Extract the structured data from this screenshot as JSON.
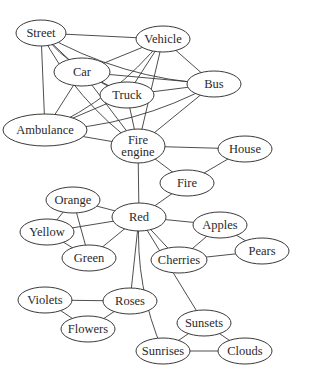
{
  "diagram": {
    "type": "semantic-network",
    "nodes": [
      {
        "id": "street",
        "label": "Street",
        "cx": 41,
        "cy": 33,
        "rx": 25,
        "ry": 13
      },
      {
        "id": "vehicle",
        "label": "Vehicle",
        "cx": 163,
        "cy": 39,
        "rx": 27,
        "ry": 13
      },
      {
        "id": "car",
        "label": "Car",
        "cx": 82,
        "cy": 72,
        "rx": 28,
        "ry": 14
      },
      {
        "id": "bus",
        "label": "Bus",
        "cx": 214,
        "cy": 84,
        "rx": 27,
        "ry": 13
      },
      {
        "id": "truck",
        "label": "Truck",
        "cx": 127,
        "cy": 95,
        "rx": 27,
        "ry": 13
      },
      {
        "id": "ambulance",
        "label": "Ambulance",
        "cx": 45,
        "cy": 130,
        "rx": 42,
        "ry": 16
      },
      {
        "id": "fire-engine",
        "label": "Fire engine",
        "lines": [
          "Fire",
          "engine"
        ],
        "cx": 138,
        "cy": 146,
        "rx": 27,
        "ry": 17
      },
      {
        "id": "house",
        "label": "House",
        "cx": 245,
        "cy": 149,
        "rx": 27,
        "ry": 13
      },
      {
        "id": "fire",
        "label": "Fire",
        "cx": 187,
        "cy": 183,
        "rx": 27,
        "ry": 13
      },
      {
        "id": "orange",
        "label": "Orange",
        "cx": 73,
        "cy": 200,
        "rx": 27,
        "ry": 13
      },
      {
        "id": "red",
        "label": "Red",
        "cx": 139,
        "cy": 217,
        "rx": 27,
        "ry": 14
      },
      {
        "id": "yellow",
        "label": "Yellow",
        "cx": 47,
        "cy": 232,
        "rx": 27,
        "ry": 13
      },
      {
        "id": "apples",
        "label": "Apples",
        "cx": 220,
        "cy": 225,
        "rx": 27,
        "ry": 13
      },
      {
        "id": "green",
        "label": "Green",
        "cx": 89,
        "cy": 258,
        "rx": 27,
        "ry": 13
      },
      {
        "id": "cherries",
        "label": "Cherries",
        "cx": 179,
        "cy": 260,
        "rx": 28,
        "ry": 13
      },
      {
        "id": "pears",
        "label": "Pears",
        "cx": 262,
        "cy": 251,
        "rx": 27,
        "ry": 13
      },
      {
        "id": "violets",
        "label": "Violets",
        "cx": 45,
        "cy": 300,
        "rx": 27,
        "ry": 13
      },
      {
        "id": "roses",
        "label": "Roses",
        "cx": 130,
        "cy": 301,
        "rx": 27,
        "ry": 13
      },
      {
        "id": "flowers",
        "label": "Flowers",
        "cx": 88,
        "cy": 329,
        "rx": 27,
        "ry": 13
      },
      {
        "id": "sunsets",
        "label": "Sunsets",
        "cx": 204,
        "cy": 323,
        "rx": 27,
        "ry": 13
      },
      {
        "id": "sunrises",
        "label": "Sunrises",
        "cx": 163,
        "cy": 351,
        "rx": 27,
        "ry": 13
      },
      {
        "id": "clouds",
        "label": "Clouds",
        "cx": 245,
        "cy": 351,
        "rx": 27,
        "ry": 13
      }
    ],
    "edges": [
      [
        "street",
        "vehicle"
      ],
      [
        "street",
        "car"
      ],
      [
        "street",
        "bus"
      ],
      [
        "street",
        "truck"
      ],
      [
        "street",
        "ambulance"
      ],
      [
        "street",
        "fire-engine"
      ],
      [
        "vehicle",
        "car"
      ],
      [
        "vehicle",
        "bus"
      ],
      [
        "vehicle",
        "truck"
      ],
      [
        "vehicle",
        "ambulance"
      ],
      [
        "vehicle",
        "fire-engine"
      ],
      [
        "car",
        "bus"
      ],
      [
        "car",
        "truck"
      ],
      [
        "car",
        "ambulance"
      ],
      [
        "car",
        "fire-engine"
      ],
      [
        "bus",
        "truck"
      ],
      [
        "bus",
        "ambulance"
      ],
      [
        "bus",
        "fire-engine"
      ],
      [
        "truck",
        "ambulance"
      ],
      [
        "truck",
        "fire-engine"
      ],
      [
        "ambulance",
        "fire-engine"
      ],
      [
        "fire-engine",
        "house"
      ],
      [
        "fire-engine",
        "fire"
      ],
      [
        "fire-engine",
        "red"
      ],
      [
        "house",
        "fire"
      ],
      [
        "fire",
        "red"
      ],
      [
        "red",
        "orange"
      ],
      [
        "red",
        "yellow"
      ],
      [
        "red",
        "green"
      ],
      [
        "red",
        "apples"
      ],
      [
        "red",
        "cherries"
      ],
      [
        "red",
        "roses"
      ],
      [
        "red",
        "sunsets"
      ],
      [
        "red",
        "sunrises"
      ],
      [
        "orange",
        "yellow"
      ],
      [
        "orange",
        "green"
      ],
      [
        "yellow",
        "green"
      ],
      [
        "apples",
        "cherries"
      ],
      [
        "apples",
        "pears"
      ],
      [
        "cherries",
        "pears"
      ],
      [
        "violets",
        "roses"
      ],
      [
        "violets",
        "flowers"
      ],
      [
        "roses",
        "flowers"
      ],
      [
        "sunsets",
        "sunrises"
      ],
      [
        "sunsets",
        "clouds"
      ],
      [
        "sunrises",
        "clouds"
      ]
    ],
    "curved_edges": {
      "street-fire-engine": 1,
      "street-ambulance": 0,
      "street-truck": 1,
      "street-bus": 1,
      "vehicle-ambulance": -1,
      "bus-ambulance": -1,
      "red-sunrises": 1,
      "red-sunsets": 0
    },
    "colors": {
      "stroke": "#3a3a3a",
      "text": "#2a2a2a",
      "background": "#ffffff"
    }
  }
}
